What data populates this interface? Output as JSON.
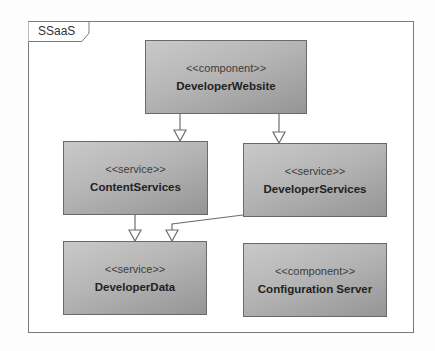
{
  "diagram": {
    "type": "UML component diagram",
    "frame": {
      "label": "SSaaS"
    },
    "nodes": [
      {
        "id": "developer-website",
        "stereotype": "<<component>>",
        "name": "DeveloperWebsite"
      },
      {
        "id": "content-services",
        "stereotype": "<<service>>",
        "name": "ContentServices"
      },
      {
        "id": "developer-services",
        "stereotype": "<<service>>",
        "name": "DeveloperServices"
      },
      {
        "id": "developer-data",
        "stereotype": "<<service>>",
        "name": "DeveloperData"
      },
      {
        "id": "configuration-server",
        "stereotype": "<<component>>",
        "name": "Configuration Server"
      }
    ],
    "edges": [
      {
        "from": "DeveloperWebsite",
        "to": "ContentServices",
        "arrow": "hollow-triangle"
      },
      {
        "from": "DeveloperWebsite",
        "to": "DeveloperServices",
        "arrow": "hollow-triangle"
      },
      {
        "from": "ContentServices",
        "to": "DeveloperData",
        "arrow": "hollow-triangle"
      },
      {
        "from": "DeveloperServices",
        "to": "DeveloperData",
        "arrow": "hollow-triangle"
      }
    ]
  },
  "colors": {
    "box_fill_light": "#c9c9c9",
    "box_fill_dark": "#959595",
    "box_border": "#6a6a6a",
    "line": "#6e6e6e",
    "frame_border": "#7a7a7a"
  }
}
